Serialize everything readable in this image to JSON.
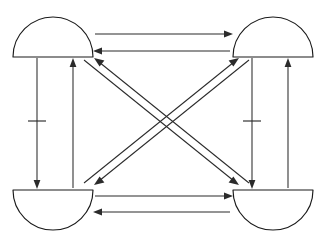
{
  "figure": {
    "kind": "node-link-diagram",
    "background_color": "#ffffff",
    "stroke_color": "#2b2b2b",
    "node_stroke_color": "#1a1a1a",
    "node_fill_color": "#ffffff",
    "width": 327,
    "height": 235
  },
  "nodes": [
    {
      "id": "top-left",
      "shape": "semicircle-dome",
      "label": "",
      "cx": 53,
      "cy": 57,
      "radius": 40,
      "orientation": "up"
    },
    {
      "id": "top-right",
      "shape": "semicircle-dome",
      "label": "",
      "cx": 273,
      "cy": 57,
      "radius": 40,
      "orientation": "up"
    },
    {
      "id": "bottom-left",
      "shape": "semicircle-bowl",
      "label": "",
      "cx": 53,
      "cy": 190,
      "radius": 40,
      "orientation": "down"
    },
    {
      "id": "bottom-right",
      "shape": "semicircle-bowl",
      "label": "",
      "cx": 273,
      "cy": 190,
      "radius": 40,
      "orientation": "down"
    }
  ],
  "edges": [
    {
      "id": "top-lr",
      "from": "top-left",
      "to": "top-right",
      "direction": "right",
      "label": "",
      "tick": false
    },
    {
      "id": "top-rl",
      "from": "top-right",
      "to": "top-left",
      "direction": "left",
      "label": "",
      "tick": false
    },
    {
      "id": "bottom-lr",
      "from": "bottom-left",
      "to": "bottom-right",
      "direction": "right",
      "label": "",
      "tick": false
    },
    {
      "id": "bottom-rl",
      "from": "bottom-right",
      "to": "bottom-left",
      "direction": "left",
      "label": "",
      "tick": false
    },
    {
      "id": "left-down",
      "from": "top-left",
      "to": "bottom-left",
      "direction": "down",
      "label": "",
      "tick": true
    },
    {
      "id": "left-up",
      "from": "bottom-left",
      "to": "top-left",
      "direction": "up",
      "label": "",
      "tick": false
    },
    {
      "id": "right-down",
      "from": "top-right",
      "to": "bottom-right",
      "direction": "down",
      "label": "",
      "tick": true
    },
    {
      "id": "right-up",
      "from": "bottom-right",
      "to": "top-right",
      "direction": "up",
      "label": "",
      "tick": false
    },
    {
      "id": "diag-tl-br",
      "from": "top-left",
      "to": "bottom-right",
      "direction": "down-right",
      "label": "",
      "tick": false
    },
    {
      "id": "diag-br-tl",
      "from": "bottom-right",
      "to": "top-left",
      "direction": "up-left",
      "label": "",
      "tick": false
    },
    {
      "id": "diag-bl-tr",
      "from": "bottom-left",
      "to": "top-right",
      "direction": "up-right",
      "label": "",
      "tick": false
    },
    {
      "id": "diag-tr-bl",
      "from": "top-right",
      "to": "bottom-left",
      "direction": "down-left",
      "label": "",
      "tick": false
    }
  ]
}
